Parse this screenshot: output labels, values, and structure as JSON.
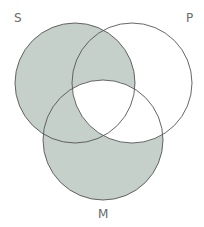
{
  "diagram": {
    "type": "venn-3",
    "fill_color": "#c4d0c9",
    "stroke_color": "#555555",
    "background": "#ffffff",
    "sets": [
      {
        "id": "S",
        "label": "S",
        "cx": 75,
        "cy": 83,
        "r": 60
      },
      {
        "id": "P",
        "label": "P",
        "cx": 132,
        "cy": 83,
        "r": 60
      },
      {
        "id": "M",
        "label": "M",
        "cx": 103,
        "cy": 140,
        "r": 60
      }
    ],
    "shaded_regions": [
      "S only",
      "S∩P not M",
      "S∩M not P",
      "M only"
    ],
    "unshaded_regions": [
      "P only",
      "P∩M not S",
      "S∩P∩M"
    ]
  }
}
